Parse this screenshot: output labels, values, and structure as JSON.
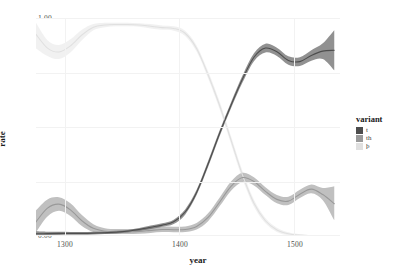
{
  "chart_data": {
    "type": "line",
    "title": "",
    "xlabel": "year",
    "ylabel": "rate",
    "xlim": [
      1275,
      1540
    ],
    "ylim": [
      0.0,
      1.0
    ],
    "xticks": [
      1300,
      1400,
      1500
    ],
    "xtick_labels": [
      "1300",
      "1400",
      "1500"
    ],
    "yticks": [
      0.0,
      0.25,
      0.5,
      0.75,
      1.0
    ],
    "ytick_labels": [
      "0.00",
      "0.25",
      "0.50",
      "0.75",
      "1.00"
    ],
    "grid": true,
    "legend_position": "right",
    "legend_title": "variant",
    "ribbon": "confidence interval",
    "series": [
      {
        "name": "t",
        "color": "#4d4d4d",
        "x": [
          1275,
          1285,
          1295,
          1305,
          1315,
          1325,
          1335,
          1345,
          1355,
          1365,
          1375,
          1385,
          1395,
          1405,
          1415,
          1425,
          1435,
          1445,
          1455,
          1465,
          1475,
          1485,
          1495,
          1505,
          1515,
          1525,
          1535
        ],
        "values": [
          0.01,
          0.011,
          0.012,
          0.012,
          0.012,
          0.013,
          0.015,
          0.018,
          0.022,
          0.03,
          0.04,
          0.05,
          0.065,
          0.11,
          0.2,
          0.33,
          0.47,
          0.6,
          0.72,
          0.82,
          0.862,
          0.845,
          0.805,
          0.8,
          0.828,
          0.848,
          0.852
        ],
        "lower": [
          0.002,
          0.003,
          0.005,
          0.006,
          0.006,
          0.007,
          0.009,
          0.012,
          0.016,
          0.023,
          0.032,
          0.042,
          0.055,
          0.098,
          0.188,
          0.316,
          0.456,
          0.586,
          0.704,
          0.802,
          0.842,
          0.826,
          0.786,
          0.78,
          0.804,
          0.812,
          0.76
        ],
        "upper": [
          0.022,
          0.02,
          0.019,
          0.018,
          0.018,
          0.019,
          0.021,
          0.024,
          0.028,
          0.037,
          0.048,
          0.058,
          0.075,
          0.122,
          0.212,
          0.344,
          0.484,
          0.614,
          0.736,
          0.838,
          0.882,
          0.864,
          0.824,
          0.82,
          0.852,
          0.884,
          0.944
        ]
      },
      {
        "name": "th",
        "color": "#999999",
        "x": [
          1275,
          1285,
          1295,
          1305,
          1315,
          1325,
          1335,
          1345,
          1355,
          1365,
          1375,
          1385,
          1395,
          1405,
          1415,
          1425,
          1435,
          1445,
          1455,
          1465,
          1475,
          1485,
          1495,
          1505,
          1515,
          1525,
          1535
        ],
        "values": [
          0.065,
          0.128,
          0.146,
          0.12,
          0.07,
          0.035,
          0.022,
          0.02,
          0.02,
          0.021,
          0.026,
          0.03,
          0.029,
          0.03,
          0.044,
          0.085,
          0.155,
          0.228,
          0.268,
          0.25,
          0.205,
          0.168,
          0.16,
          0.192,
          0.215,
          0.19,
          0.148
        ],
        "lower": [
          0.018,
          0.09,
          0.116,
          0.092,
          0.046,
          0.018,
          0.01,
          0.009,
          0.009,
          0.01,
          0.014,
          0.018,
          0.017,
          0.018,
          0.03,
          0.068,
          0.136,
          0.208,
          0.248,
          0.232,
          0.188,
          0.15,
          0.142,
          0.174,
          0.196,
          0.164,
          0.072
        ],
        "upper": [
          0.118,
          0.168,
          0.178,
          0.15,
          0.096,
          0.054,
          0.036,
          0.032,
          0.032,
          0.033,
          0.038,
          0.043,
          0.042,
          0.044,
          0.06,
          0.104,
          0.176,
          0.25,
          0.29,
          0.27,
          0.224,
          0.188,
          0.18,
          0.212,
          0.236,
          0.22,
          0.228
        ]
      },
      {
        "name": "þ",
        "color": "#e0e0e0",
        "x": [
          1275,
          1285,
          1295,
          1305,
          1315,
          1325,
          1335,
          1345,
          1355,
          1365,
          1375,
          1385,
          1395,
          1405,
          1415,
          1425,
          1435,
          1445,
          1455,
          1465,
          1475,
          1485,
          1495,
          1505,
          1515,
          1525,
          1535
        ],
        "values": [
          0.925,
          0.862,
          0.844,
          0.872,
          0.922,
          0.958,
          0.968,
          0.97,
          0.97,
          0.968,
          0.962,
          0.956,
          0.952,
          0.93,
          0.86,
          0.74,
          0.6,
          0.44,
          0.28,
          0.15,
          0.07,
          0.028,
          0.01,
          0.004,
          0.002,
          0.001,
          0.001
        ],
        "lower": [
          0.86,
          0.826,
          0.812,
          0.842,
          0.898,
          0.944,
          0.958,
          0.962,
          0.962,
          0.96,
          0.952,
          0.946,
          0.942,
          0.918,
          0.846,
          0.724,
          0.582,
          0.422,
          0.262,
          0.134,
          0.058,
          0.018,
          0.003,
          0.0,
          0.0,
          0.0,
          0.0
        ],
        "upper": [
          0.978,
          0.898,
          0.876,
          0.902,
          0.946,
          0.972,
          0.978,
          0.978,
          0.978,
          0.976,
          0.972,
          0.966,
          0.962,
          0.942,
          0.874,
          0.756,
          0.618,
          0.458,
          0.298,
          0.166,
          0.082,
          0.038,
          0.017,
          0.008,
          0.004,
          0.003,
          0.003
        ]
      }
    ]
  },
  "axes": {
    "ylabel": "rate",
    "xlabel": "year",
    "ytick_labels": [
      "0.00",
      "0.25",
      "0.50",
      "0.75",
      "1.00"
    ],
    "xtick_labels": [
      "1300",
      "1400",
      "1500"
    ]
  },
  "legend": {
    "title": "variant",
    "items": [
      {
        "label": "t",
        "color": "#4d4d4d"
      },
      {
        "label": "th",
        "color": "#999999"
      },
      {
        "label": "þ",
        "color": "#e0e0e0"
      }
    ]
  }
}
